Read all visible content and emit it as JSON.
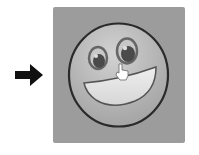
{
  "icons": {
    "pointer_arrow": "right-arrow-icon",
    "tile": "smiley-face-icon",
    "cursor": "hand-pointer-cursor"
  },
  "colors": {
    "tile": "#9c9c9c",
    "face": "#b4b4b4",
    "face_highlight": "#cfcfcf",
    "outline": "#2a2a2a",
    "mouth": "#e2e2e2",
    "pupil": "#4a4a4a",
    "arrow": "#111111"
  }
}
